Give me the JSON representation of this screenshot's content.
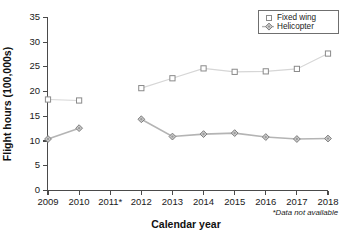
{
  "chart_data": {
    "type": "line",
    "title": "",
    "xlabel": "Calendar year",
    "ylabel": "Flight hours (100,000s)",
    "categories": [
      "2009",
      "2010",
      "2011*",
      "2012",
      "2013",
      "2014",
      "2015",
      "2016",
      "2017",
      "2018"
    ],
    "xlim": [
      0,
      9
    ],
    "ylim": [
      0,
      35
    ],
    "yticks": [
      0,
      5,
      10,
      15,
      20,
      25,
      30,
      35
    ],
    "ytick_labels": [
      "0",
      "5",
      "10",
      "15",
      "20",
      "25",
      "30",
      "35"
    ],
    "grid": false,
    "legend_position": "top-right",
    "series": [
      {
        "name": "Fixed wing",
        "marker": "open-square",
        "values": [
          18.4,
          18.2,
          null,
          20.7,
          22.7,
          24.7,
          24.0,
          24.1,
          24.6,
          27.7
        ]
      },
      {
        "name": "Helicopter",
        "marker": "filled-diamond",
        "values": [
          10.4,
          12.6,
          null,
          14.4,
          10.9,
          11.4,
          11.6,
          10.8,
          10.4,
          10.5
        ]
      }
    ],
    "annotations": [
      {
        "name": "footnote",
        "text": "*Data not available"
      }
    ]
  },
  "legend": {
    "items": [
      {
        "label": "Fixed wing",
        "marker": "open-square"
      },
      {
        "label": "Helicopter",
        "marker": "filled-diamond"
      }
    ]
  },
  "axes": {
    "x_title": "Calendar year",
    "y_title": "Flight hours (100,000s)",
    "x_labels": [
      "2009",
      "2010",
      "2011*",
      "2012",
      "2013",
      "2014",
      "2015",
      "2016",
      "2017",
      "2018"
    ],
    "y_labels": [
      "0",
      "5",
      "10",
      "15",
      "20",
      "25",
      "30",
      "35"
    ]
  },
  "footnote": {
    "text": "*Data not available"
  },
  "colors": {
    "fixed_wing_line": "#d6d6d6",
    "fixed_wing_marker_stroke": "#8a8a8a",
    "helicopter_line": "#b4b4b4",
    "helicopter_marker_fill": "#c9c9c9",
    "axis": "#4a4a4a",
    "background": "#ffffff"
  }
}
